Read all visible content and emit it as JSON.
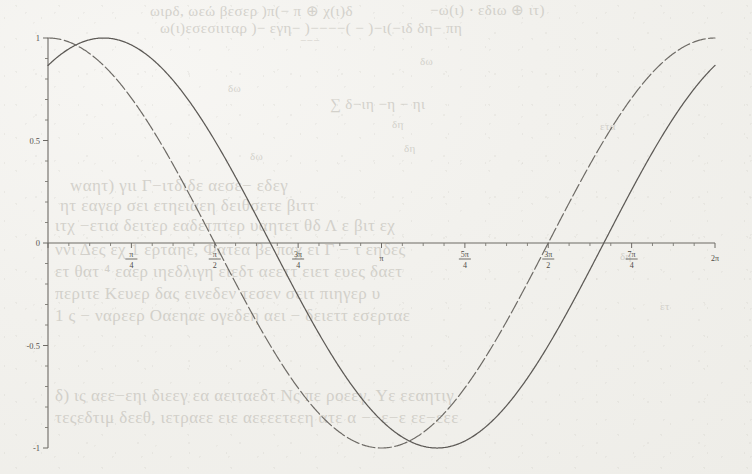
{
  "document": {
    "kind": "scanned-textbook-page",
    "background_color": "#f2f1ed",
    "ink_color": "#5d5a56",
    "bleed_color": "#b9b6ae"
  },
  "bleed_text": [
    {
      "text": "ωιρδ, ωεώ βεσερ )π(− π ⊕ χ(ι)δ",
      "x": 150,
      "y": 2,
      "size": "b-med"
    },
    {
      "text": "−ω(ι) ⋅ εδιω ⊕ ιτ)",
      "x": 430,
      "y": 1,
      "size": "b-med"
    },
    {
      "text": "ω(ι)εσεσιιταρ )− εγη− )−−−−( − )−ι(−ιδ δη− πη",
      "x": 160,
      "y": 20,
      "size": "b-med"
    },
    {
      "text": "−−−",
      "x": 300,
      "y": 34,
      "size": "b-sm"
    },
    {
      "text": "δω",
      "x": 420,
      "y": 55,
      "size": "b-sm"
    },
    {
      "text": "δω",
      "x": 228,
      "y": 82,
      "size": "b-sm"
    },
    {
      "text": "∑  δ−ιη  −η − ηι",
      "x": 330,
      "y": 96,
      "size": "b-med"
    },
    {
      "text": "δη",
      "x": 392,
      "y": 118,
      "size": "b-sm"
    },
    {
      "text": "δη",
      "x": 404,
      "y": 142,
      "size": "b-sm"
    },
    {
      "text": "δω",
      "x": 250,
      "y": 150,
      "size": "b-sm"
    },
    {
      "text": "wαητ) γιι  Γ−ιτδιδε αεσε− εδεγ",
      "x": 70,
      "y": 176,
      "size": "b-big"
    },
    {
      "text": "ητ εαγερ σει ετηειαεη δειθσετε βιττ",
      "x": 60,
      "y": 196,
      "size": "b-big"
    },
    {
      "text": "ιτχ −ετια δειτερ εαδετπτερ υαητετ θδ Λ ε βιτ εχ",
      "x": 55,
      "y": 216,
      "size": "b-big"
    },
    {
      "text": "ννι Δες εχ 1 ερταηε, Фατεα βε παχ ει Γ − τ εηδες",
      "x": 55,
      "y": 240,
      "size": "b-big"
    },
    {
      "text": "ετ θατ ⁴ εαερ ιηεδλιγη ειεδτ αεεττ ειετ ευες δαετ",
      "x": 55,
      "y": 262,
      "size": "b-big"
    },
    {
      "text": "περιτε Κευερ δας εινεδεν  τεσεν  σειτ πιηγερ  υ",
      "x": 55,
      "y": 284,
      "size": "b-big"
    },
    {
      "text": "1 ς − ναρεερ Οαεηαε ογεδεη αει − δειεττ εσερταε",
      "x": 55,
      "y": 306,
      "size": "b-big"
    },
    {
      "text": "δ) ις αεε−εηι διεεγ εα αειταεδτ Νς πε ροεεγ. Υε εεαητιγ",
      "x": 55,
      "y": 386,
      "size": "b-big"
    },
    {
      "text": "τεςεδτιμ δεεθ, ιετραεε ειε αεεεετεεη ατε α −−ε−ε εε−εεε",
      "x": 55,
      "y": 408,
      "size": "b-big"
    },
    {
      "text": "ετα",
      "x": 600,
      "y": 120,
      "size": "b-sm"
    },
    {
      "text": "δη",
      "x": 620,
      "y": 250,
      "size": "b-sm"
    },
    {
      "text": "ετ",
      "x": 660,
      "y": 300,
      "size": "b-sm"
    }
  ],
  "chart_data": {
    "type": "line",
    "title": "",
    "xlabel": "",
    "ylabel": "",
    "xlim": [
      0,
      6.283185307179586
    ],
    "ylim": [
      -1.08,
      1.08
    ],
    "grid": false,
    "legend": "none",
    "x_tick_labels": [
      {
        "value": 0,
        "num": "",
        "den": "",
        "whole": "",
        "show": false
      },
      {
        "value": 0.7853981634,
        "num": "π",
        "den": "4",
        "whole": "",
        "show": true
      },
      {
        "value": 1.5707963268,
        "num": "π",
        "den": "2",
        "whole": "",
        "show": true
      },
      {
        "value": 2.3561944902,
        "num": "3π",
        "den": "4",
        "whole": "",
        "show": true
      },
      {
        "value": 3.1415926536,
        "num": "",
        "den": "",
        "whole": "π",
        "show": true
      },
      {
        "value": 3.926990817,
        "num": "5π",
        "den": "4",
        "whole": "",
        "show": true
      },
      {
        "value": 4.7123889804,
        "num": "3π",
        "den": "2",
        "whole": "",
        "show": true
      },
      {
        "value": 5.4977871438,
        "num": "7π",
        "den": "4",
        "whole": "",
        "show": true
      },
      {
        "value": 6.2831853072,
        "num": "",
        "den": "",
        "whole": "2π",
        "show": true
      }
    ],
    "x_minor_ticks_per_major": 4,
    "y_tick_labels": [
      {
        "value": 1,
        "label": "1"
      },
      {
        "value": 0.5,
        "label": "0.5"
      },
      {
        "value": 0,
        "label": "0"
      },
      {
        "value": -0.5,
        "label": "-0.5"
      },
      {
        "value": -1,
        "label": "-1"
      }
    ],
    "y_minor_ticks_per_major": 5,
    "series": [
      {
        "name": "solid-wave",
        "style": "solid",
        "color": "#5d5a56",
        "amplitude": 1,
        "period": 6.283185307179586,
        "phase": -0.5235987756,
        "description": "sine-like curve rising from 0 at x=0, peak near x=0.52π/... crosses zero descending near π/2 region, minimum near π, peak again near 5π/4, zero at 3π/2, minimum near 2π",
        "key_points": [
          {
            "x": 0.0,
            "y": 0.0
          },
          {
            "x": 0.524,
            "y": 1.0
          },
          {
            "x": 1.571,
            "y": 0.0
          },
          {
            "x": 2.618,
            "y": -1.0
          },
          {
            "x": 3.665,
            "y": 0.0
          },
          {
            "x": 4.712,
            "y": 1.0
          },
          {
            "x": 5.76,
            "y": 0.0
          },
          {
            "x": 6.283,
            "y": -0.5
          }
        ]
      },
      {
        "name": "dashed-wave",
        "style": "dashed",
        "color": "#6e6b66",
        "amplitude": 1,
        "period": 6.283185307179586,
        "phase": 0,
        "description": "cosine-like curve starting at 1 at x=0, descending through zero near π/2, minimum near π, rising back to 1 at 2π",
        "key_points": [
          {
            "x": 0.0,
            "y": 1.0
          },
          {
            "x": 1.571,
            "y": 0.0
          },
          {
            "x": 3.142,
            "y": -1.0
          },
          {
            "x": 4.712,
            "y": 0.0
          },
          {
            "x": 6.283,
            "y": 1.0
          }
        ]
      }
    ]
  }
}
